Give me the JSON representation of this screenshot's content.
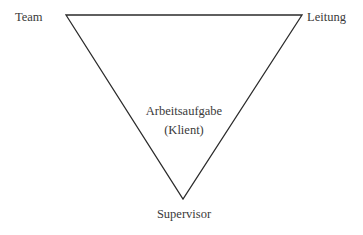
{
  "diagram": {
    "type": "inverted-triangle",
    "colors": {
      "line": "#2b2b2b",
      "text": "#3a3a3a",
      "background": "#ffffff"
    },
    "vertices": {
      "top_left": {
        "label": "Team"
      },
      "top_right": {
        "label": "Leitung"
      },
      "bottom": {
        "label": "Supervisor"
      }
    },
    "center": {
      "title": "Arbeitsaufgabe",
      "subtitle": "(Klient)"
    }
  }
}
